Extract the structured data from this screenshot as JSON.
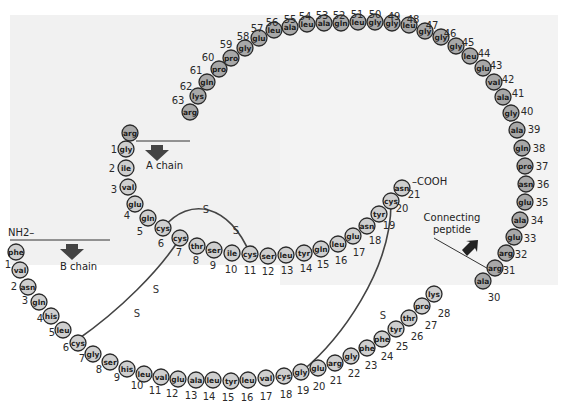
{
  "colors": {
    "chain_fill": "#cfcfcf",
    "peptide_fill": "#a8a8a8",
    "stroke": "#2a2a2a",
    "bond": "#444444"
  },
  "labels": {
    "a_chain": "A chain",
    "b_chain": "B chain",
    "connecting": "Connecting",
    "peptide": "peptide",
    "nh2": "NH2–",
    "cooh": "–COOH",
    "sulfur": "S"
  },
  "b_chain": [
    {
      "n": "1",
      "aa": "phe",
      "x": 16,
      "y": 248,
      "nx": 8,
      "ny": 260
    },
    {
      "n": "",
      "aa": "val",
      "x": 20,
      "y": 266,
      "nx": 0,
      "ny": 0
    },
    {
      "n": "2",
      "aa": "asn",
      "x": 27,
      "y": 283,
      "nx": 14,
      "ny": 283
    },
    {
      "n": "3",
      "aa": "gln",
      "x": 37,
      "y": 299,
      "nx": 24,
      "ny": 298
    },
    {
      "n": "4",
      "aa": "his",
      "x": 50,
      "y": 313,
      "nx": 40,
      "ny": 318
    },
    {
      "n": "5",
      "aa": "leu",
      "x": 63,
      "y": 327,
      "nx": 52,
      "ny": 331
    },
    {
      "n": "6",
      "aa": "cys",
      "x": 77,
      "y": 340,
      "nx": 66,
      "ny": 345
    },
    {
      "n": "7",
      "aa": "gly",
      "x": 92,
      "y": 351,
      "nx": 82,
      "ny": 358
    },
    {
      "n": "8",
      "aa": "ser",
      "x": 108,
      "y": 360,
      "nx": 99,
      "ny": 368
    },
    {
      "n": "9",
      "aa": "his",
      "x": 125,
      "y": 368,
      "nx": 117,
      "ny": 376
    },
    {
      "n": "10",
      "aa": "leu",
      "x": 142,
      "y": 373,
      "nx": 137,
      "ny": 384
    },
    {
      "n": "11",
      "aa": "val",
      "x": 160,
      "y": 376,
      "nx": 155,
      "ny": 389
    },
    {
      "n": "12",
      "aa": "glu",
      "x": 178,
      "y": 378,
      "nx": 172,
      "ny": 392
    },
    {
      "n": "13",
      "aa": "ala",
      "x": 195,
      "y": 380,
      "nx": 191,
      "ny": 394
    },
    {
      "n": "14",
      "aa": "leu",
      "x": 213,
      "y": 380,
      "nx": 209,
      "ny": 396
    },
    {
      "n": "15",
      "aa": "tyr",
      "x": 231,
      "y": 380,
      "nx": 228,
      "ny": 397
    },
    {
      "n": "16",
      "aa": "leu",
      "x": 248,
      "y": 379,
      "nx": 247,
      "ny": 396
    },
    {
      "n": "17",
      "aa": "val",
      "x": 266,
      "y": 377,
      "nx": 266,
      "ny": 395
    },
    {
      "n": "18",
      "aa": "cys",
      "x": 284,
      "y": 375,
      "nx": 286,
      "ny": 393
    },
    {
      "n": "19",
      "aa": "gly",
      "x": 301,
      "y": 372,
      "nx": 303,
      "ny": 389
    },
    {
      "n": "20",
      "aa": "glu",
      "x": 318,
      "y": 367,
      "nx": 319,
      "ny": 384
    },
    {
      "n": "21",
      "aa": "arg",
      "x": 335,
      "y": 362,
      "nx": 336,
      "ny": 378
    },
    {
      "n": "22",
      "aa": "gly",
      "x": 351,
      "y": 355,
      "nx": 354,
      "ny": 372
    },
    {
      "n": "23",
      "aa": "phe",
      "x": 366,
      "y": 347,
      "nx": 371,
      "ny": 364
    },
    {
      "n": "24",
      "aa": "phe",
      "x": 381,
      "y": 338,
      "nx": 387,
      "ny": 354
    },
    {
      "n": "25",
      "aa": "tyr",
      "x": 395,
      "y": 329,
      "nx": 402,
      "ny": 345
    },
    {
      "n": "26",
      "aa": "thr",
      "x": 409,
      "y": 318,
      "nx": 417,
      "ny": 335
    },
    {
      "n": "27",
      "aa": "pro",
      "x": 422,
      "y": 307,
      "nx": 431,
      "ny": 324
    },
    {
      "n": "28",
      "aa": "lys",
      "x": 434,
      "y": 295,
      "nx": 444,
      "ny": 313
    },
    {
      "n": "29",
      "aa": "ala",
      "x": 446,
      "y": 282,
      "nx": 456,
      "ny": 298
    },
    {
      "n": "30",
      "aa": "",
      "x": 0,
      "y": 0,
      "nx": 0,
      "ny": 0
    }
  ],
  "b_chain_fix": "positions for b chain residues",
  "a_chain": [
    {
      "n": "1",
      "aa": "gly",
      "x": 126,
      "y": 149,
      "nx": 114,
      "ny": 149
    },
    {
      "n": "2",
      "aa": "ile",
      "x": 126,
      "y": 168,
      "nx": 112,
      "ny": 168
    },
    {
      "n": "3",
      "aa": "val",
      "x": 128,
      "y": 187,
      "nx": 114,
      "ny": 189
    },
    {
      "n": "4",
      "aa": "glu",
      "x": 135,
      "y": 204,
      "nx": 127,
      "ny": 215
    },
    {
      "n": "5",
      "aa": "gln",
      "x": 148,
      "y": 218,
      "nx": 140,
      "ny": 231
    },
    {
      "n": "6",
      "aa": "cys",
      "x": 163,
      "y": 228,
      "nx": 161,
      "ny": 243
    },
    {
      "n": "7",
      "aa": "cys",
      "x": 180,
      "y": 238,
      "nx": 179,
      "ny": 252
    },
    {
      "n": "8",
      "aa": "thr",
      "x": 197,
      "y": 246,
      "nx": 196,
      "ny": 260
    },
    {
      "n": "9",
      "aa": "ser",
      "x": 214,
      "y": 250,
      "nx": 213,
      "ny": 265
    },
    {
      "n": "10",
      "aa": "ile",
      "x": 232,
      "y": 253,
      "nx": 231,
      "ny": 269
    },
    {
      "n": "11",
      "aa": "cys",
      "x": 250,
      "y": 254,
      "nx": 250,
      "ny": 270
    },
    {
      "n": "12",
      "aa": "ser",
      "x": 268,
      "y": 256,
      "nx": 268,
      "ny": 271
    },
    {
      "n": "13",
      "aa": "leu",
      "x": 286,
      "y": 255,
      "nx": 287,
      "ny": 270
    },
    {
      "n": "14",
      "aa": "tyr",
      "x": 304,
      "y": 253,
      "nx": 306,
      "ny": 268
    },
    {
      "n": "15",
      "aa": "gln",
      "x": 321,
      "y": 249,
      "nx": 323,
      "ny": 264
    },
    {
      "n": "16",
      "aa": "leu",
      "x": 338,
      "y": 244,
      "nx": 341,
      "ny": 260
    },
    {
      "n": "17",
      "aa": "glu",
      "x": 353,
      "y": 236,
      "nx": 359,
      "ny": 252
    },
    {
      "n": "18",
      "aa": "asn",
      "x": 367,
      "y": 226,
      "nx": 375,
      "ny": 240
    },
    {
      "n": "19",
      "aa": "tyr",
      "x": 379,
      "y": 214,
      "nx": 389,
      "ny": 225
    },
    {
      "n": "20",
      "aa": "cys",
      "x": 391,
      "y": 201,
      "nx": 402,
      "ny": 208
    },
    {
      "n": "21",
      "aa": "asn",
      "x": 402,
      "y": 188,
      "nx": 414,
      "ny": 194
    }
  ],
  "peptide": [
    {
      "n": "30",
      "aa": "ala",
      "x": 483,
      "y": 281,
      "nx": 494,
      "ny": 297
    },
    {
      "n": "31",
      "aa": "arg",
      "x": 495,
      "y": 268,
      "nx": 509,
      "ny": 270
    },
    {
      "n": "32",
      "aa": "arg",
      "x": 506,
      "y": 253,
      "nx": 521,
      "ny": 254
    },
    {
      "n": "33",
      "aa": "glu",
      "x": 514,
      "y": 237,
      "nx": 530,
      "ny": 238
    },
    {
      "n": "34",
      "aa": "ala",
      "x": 520,
      "y": 220,
      "nx": 537,
      "ny": 220
    },
    {
      "n": "35",
      "aa": "glu",
      "x": 525,
      "y": 202,
      "nx": 542,
      "ny": 202
    },
    {
      "n": "36",
      "aa": "asn",
      "x": 526,
      "y": 184,
      "nx": 543,
      "ny": 184
    },
    {
      "n": "37",
      "aa": "pro",
      "x": 525,
      "y": 166,
      "nx": 542,
      "ny": 166
    },
    {
      "n": "38",
      "aa": "gln",
      "x": 522,
      "y": 148,
      "nx": 539,
      "ny": 148
    },
    {
      "n": "39",
      "aa": "ala",
      "x": 517,
      "y": 130,
      "nx": 534,
      "ny": 129
    },
    {
      "n": "40",
      "aa": "gly",
      "x": 511,
      "y": 113,
      "nx": 527,
      "ny": 111
    },
    {
      "n": "41",
      "aa": "ala",
      "x": 503,
      "y": 97,
      "nx": 518,
      "ny": 93
    },
    {
      "n": "42",
      "aa": "val",
      "x": 494,
      "y": 82,
      "nx": 508,
      "ny": 79
    },
    {
      "n": "43",
      "aa": "glu",
      "x": 483,
      "y": 68,
      "nx": 496,
      "ny": 65
    },
    {
      "n": "44",
      "aa": "leu",
      "x": 470,
      "y": 56,
      "nx": 484,
      "ny": 53
    },
    {
      "n": "45",
      "aa": "gly",
      "x": 456,
      "y": 46,
      "nx": 468,
      "ny": 42
    },
    {
      "n": "46",
      "aa": "gly",
      "x": 441,
      "y": 37,
      "nx": 450,
      "ny": 33
    },
    {
      "n": "47",
      "aa": "gly",
      "x": 425,
      "y": 31,
      "nx": 432,
      "ny": 25
    },
    {
      "n": "48",
      "aa": "leu",
      "x": 409,
      "y": 25,
      "nx": 413,
      "ny": 19
    },
    {
      "n": "49",
      "aa": "gly",
      "x": 392,
      "y": 23,
      "nx": 394,
      "ny": 16
    },
    {
      "n": "50",
      "aa": "gly",
      "x": 375,
      "y": 22,
      "nx": 375,
      "ny": 14
    },
    {
      "n": "51",
      "aa": "leu",
      "x": 358,
      "y": 22,
      "nx": 357,
      "ny": 14
    },
    {
      "n": "52",
      "aa": "gln",
      "x": 341,
      "y": 23,
      "nx": 339,
      "ny": 15
    },
    {
      "n": "53",
      "aa": "ala",
      "x": 324,
      "y": 23,
      "nx": 322,
      "ny": 15
    },
    {
      "n": "54",
      "aa": "leu",
      "x": 307,
      "y": 24,
      "nx": 305,
      "ny": 16
    },
    {
      "n": "55",
      "aa": "ala",
      "x": 290,
      "y": 27,
      "nx": 290,
      "ny": 19
    },
    {
      "n": "56",
      "aa": "leu",
      "x": 274,
      "y": 30,
      "nx": 272,
      "ny": 22
    },
    {
      "n": "57",
      "aa": "glu",
      "x": 259,
      "y": 38,
      "nx": 257,
      "ny": 28
    },
    {
      "n": "58",
      "aa": "gly",
      "x": 245,
      "y": 48,
      "nx": 243,
      "ny": 36
    },
    {
      "n": "59",
      "aa": "pro",
      "x": 231,
      "y": 58,
      "nx": 226,
      "ny": 44
    },
    {
      "n": "60",
      "aa": "pro",
      "x": 219,
      "y": 69,
      "nx": 208,
      "ny": 57
    },
    {
      "n": "61",
      "aa": "gln",
      "x": 207,
      "y": 82,
      "nx": 196,
      "ny": 70
    },
    {
      "n": "62",
      "aa": "lys",
      "x": 198,
      "y": 96,
      "nx": 186,
      "ny": 86
    },
    {
      "n": "63",
      "aa": "arg",
      "x": 190,
      "y": 112,
      "nx": 178,
      "ny": 100
    },
    {
      "n": "",
      "aa": "arg",
      "x": 130,
      "y": 133,
      "nx": 0,
      "ny": 0
    }
  ]
}
